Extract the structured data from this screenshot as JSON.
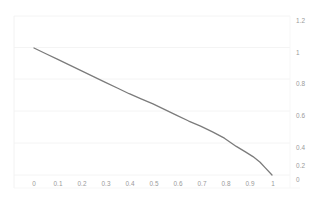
{
  "chart_data": {
    "type": "line",
    "title": "",
    "subtitle": "",
    "xlabel": "",
    "ylabel": "",
    "xlim": [
      0,
      1.1
    ],
    "ylim": [
      0,
      1.2
    ],
    "grid": true,
    "grid_color": "#f2f2f2",
    "legend": null,
    "legend_position": "none",
    "background_color": "#ffffff",
    "line_color": "#7b7b7b",
    "line_width": 1.3,
    "marker": "none",
    "x_tick_labels": [
      "0",
      "0.1",
      "0.2",
      "0.3",
      "0.4",
      "0.5",
      "0.6",
      "0.7",
      "0.8",
      "0.9",
      "1"
    ],
    "x_tick_values": [
      0,
      0.1,
      0.2,
      0.3,
      0.4,
      0.5,
      0.6,
      0.7,
      0.8,
      0.9,
      1
    ],
    "y_tick_labels": [
      "0",
      "0.2",
      "0.4",
      "0.6",
      "0.8",
      "1",
      "1.2"
    ],
    "y_tick_values": [
      0,
      0.2,
      0.4,
      0.6,
      0.8,
      1,
      1.2
    ],
    "y_axis_side": "right",
    "x_axis_side": "bottom",
    "series": [
      {
        "name": "series-1",
        "color": "#7b7b7b",
        "x": [
          0,
          0.05,
          0.1,
          0.15,
          0.2,
          0.25,
          0.3,
          0.35,
          0.4,
          0.45,
          0.5,
          0.55,
          0.6,
          0.65,
          0.7,
          0.75,
          0.8,
          0.85,
          0.89,
          0.92,
          0.95,
          0.97,
          1
        ],
        "y": [
          1.0,
          0.955,
          0.91,
          0.865,
          0.82,
          0.775,
          0.73,
          0.685,
          0.64,
          0.6,
          0.56,
          0.515,
          0.47,
          0.425,
          0.385,
          0.34,
          0.29,
          0.225,
          0.18,
          0.145,
          0.1,
          0.06,
          0.0
        ]
      }
    ],
    "annotations": []
  },
  "axes": {
    "x_tick_labels": [
      "0",
      "0.1",
      "0.2",
      "0.3",
      "0.4",
      "0.5",
      "0.6",
      "0.7",
      "0.8",
      "0.9",
      "1"
    ],
    "y_tick_labels": [
      "1.2",
      "1",
      "0.8",
      "0.6",
      "0.4",
      "0.2",
      "0"
    ]
  }
}
